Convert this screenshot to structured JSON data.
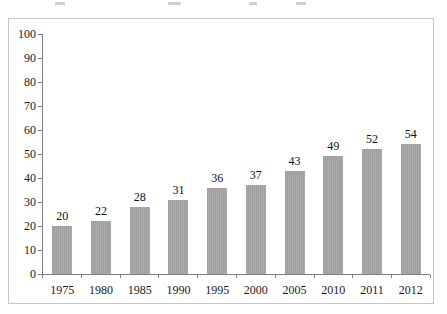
{
  "chart_data": {
    "type": "bar",
    "categories": [
      "1975",
      "1980",
      "1985",
      "1990",
      "1995",
      "2000",
      "2005",
      "2010",
      "2011",
      "2012"
    ],
    "values": [
      20,
      22,
      28,
      31,
      36,
      37,
      43,
      49,
      52,
      54
    ],
    "title": "",
    "xlabel": "",
    "ylabel": "",
    "ylim": [
      0,
      100
    ],
    "yticks": [
      0,
      10,
      20,
      30,
      40,
      50,
      60,
      70,
      80,
      90,
      100
    ],
    "grid": false,
    "legend": "none",
    "data_labels_shown": true,
    "bar_color": "#a6a6a6",
    "axis_color": "#7f7f7f",
    "frame_border_color": "#c8c8c8",
    "text_color": "#1a1a1a"
  }
}
